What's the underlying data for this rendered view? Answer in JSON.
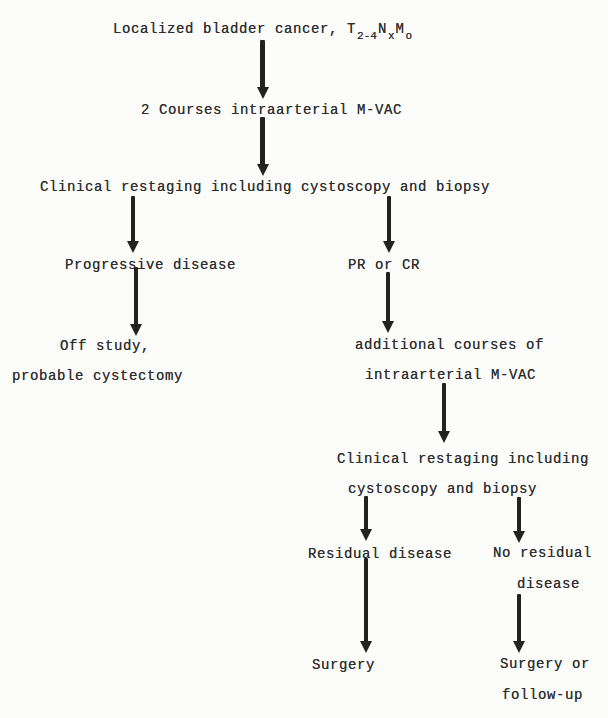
{
  "page": {
    "background_color": "#fcfcfa",
    "ink_color": "#222220",
    "text_color": "#2e2e2e"
  },
  "flowchart": {
    "nodes": {
      "start": {
        "text": "Localized bladder cancer,",
        "staging": [
          {
            "base": "T",
            "sub": "2-4"
          },
          {
            "base": "N",
            "sub": "x"
          },
          {
            "base": "M",
            "sub": "o"
          }
        ]
      },
      "courses1": {
        "text": "2 Courses intraarterial M-VAC"
      },
      "restage1": {
        "text": "Clinical restaging including cystoscopy and biopsy"
      },
      "progressive": {
        "text": "Progressive disease"
      },
      "off_study": {
        "lines": [
          "Off study,",
          "probable cystectomy"
        ]
      },
      "pr_cr": {
        "text": "PR or CR"
      },
      "add_courses": {
        "lines": [
          "additional courses of",
          "intraarterial M-VAC"
        ]
      },
      "restage2": {
        "lines": [
          "Clinical restaging including",
          "cystoscopy and biopsy"
        ]
      },
      "residual": {
        "text": "Residual disease"
      },
      "no_residual": {
        "lines": [
          "No residual",
          "disease"
        ]
      },
      "surgery": {
        "text": "Surgery"
      },
      "surgery_followup": {
        "lines": [
          "Surgery or",
          "follow-up"
        ]
      }
    },
    "edges": [
      {
        "from": "start",
        "to": "courses1"
      },
      {
        "from": "courses1",
        "to": "restage1"
      },
      {
        "from": "restage1",
        "to": "progressive"
      },
      {
        "from": "progressive",
        "to": "off_study"
      },
      {
        "from": "restage1",
        "to": "pr_cr"
      },
      {
        "from": "pr_cr",
        "to": "add_courses"
      },
      {
        "from": "add_courses",
        "to": "restage2"
      },
      {
        "from": "restage2",
        "to": "residual"
      },
      {
        "from": "restage2",
        "to": "no_residual"
      },
      {
        "from": "residual",
        "to": "surgery"
      },
      {
        "from": "no_residual",
        "to": "surgery_followup"
      }
    ]
  }
}
